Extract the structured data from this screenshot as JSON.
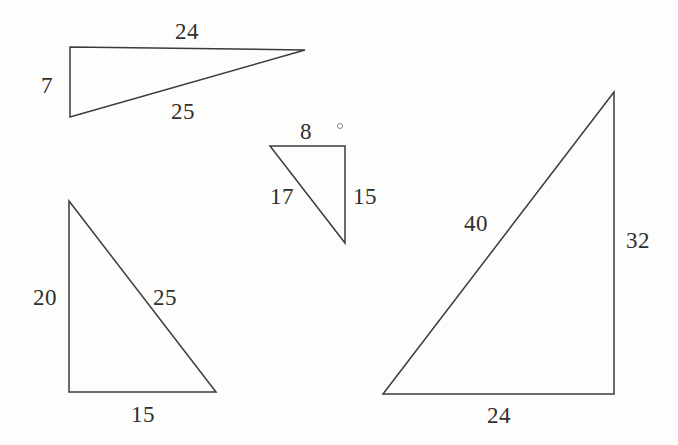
{
  "figure": {
    "type": "geometry-diagram",
    "canvas": {
      "width": 678,
      "height": 445
    },
    "colors": {
      "background": "#fdfdfb",
      "stroke": "#3b3b3b",
      "text": "#2f2f2f"
    },
    "triangles": [
      {
        "id": "triangle-top-left",
        "name": "7-24-25 triangle",
        "points": "70,47 305,50 70,117",
        "labels": [
          {
            "id": "label-7",
            "text": "7",
            "x": 47,
            "y": 85,
            "side": "vertical-leg"
          },
          {
            "id": "label-24",
            "text": "24",
            "x": 187,
            "y": 31,
            "side": "horizontal-leg"
          },
          {
            "id": "label-25",
            "text": "25",
            "x": 183,
            "y": 111,
            "side": "hypotenuse"
          }
        ]
      },
      {
        "id": "triangle-middle",
        "name": "8-15-17 triangle",
        "points": "270,146 345,146 345,243",
        "labels": [
          {
            "id": "label-8",
            "text": "8",
            "x": 306,
            "y": 131,
            "side": "horizontal-leg"
          },
          {
            "id": "label-17",
            "text": "17",
            "x": 282,
            "y": 196,
            "side": "hypotenuse"
          },
          {
            "id": "label-15",
            "text": "15",
            "x": 365,
            "y": 196,
            "side": "vertical-leg"
          }
        ]
      },
      {
        "id": "triangle-bottom-left",
        "name": "15-20-25 triangle",
        "points": "69,201 69,392 216,392",
        "labels": [
          {
            "id": "label-20",
            "text": "20",
            "x": 45,
            "y": 297,
            "side": "vertical-leg"
          },
          {
            "id": "label-25b",
            "text": "25",
            "x": 165,
            "y": 297,
            "side": "hypotenuse"
          },
          {
            "id": "label-15b",
            "text": "15",
            "x": 143,
            "y": 414,
            "side": "horizontal-leg"
          }
        ]
      },
      {
        "id": "triangle-right",
        "name": "24-32-40 triangle",
        "points": "614,92 614,394 383,394",
        "labels": [
          {
            "id": "label-40",
            "text": "40",
            "x": 476,
            "y": 223,
            "side": "hypotenuse"
          },
          {
            "id": "label-32",
            "text": "32",
            "x": 638,
            "y": 240,
            "side": "vertical-leg"
          },
          {
            "id": "label-24b",
            "text": "24",
            "x": 499,
            "y": 415,
            "side": "horizontal-leg"
          }
        ]
      }
    ],
    "specks": [
      {
        "id": "speck-1",
        "x": 337,
        "y": 123
      }
    ]
  }
}
